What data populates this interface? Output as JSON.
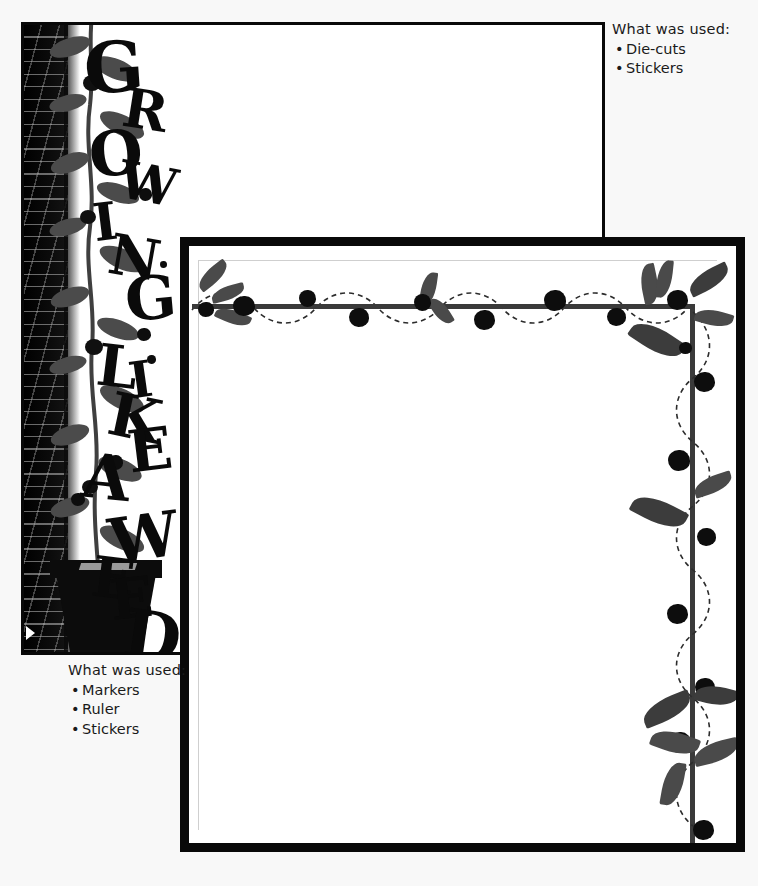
{
  "document": {
    "type": "scrapbook-layout-sketches",
    "background_color": "#f8f8f8",
    "page_count": 2
  },
  "captions": [
    {
      "id": "die-cuts",
      "title": "What was used:",
      "items": [
        "Die-cuts",
        "Stickers"
      ]
    },
    {
      "id": "markers",
      "title": "What was used:",
      "items": [
        "Markers",
        "Ruler",
        "Stickers"
      ]
    }
  ],
  "layouts": [
    {
      "id": "page-1",
      "name": "Growing Like a Weed layout",
      "title_text": "GROWING LIKE A WEED",
      "title_letters": [
        "G",
        "R",
        "O",
        "W",
        "I",
        "N",
        "G",
        "L",
        "I",
        "K",
        "E",
        "A",
        "W",
        "E",
        "E",
        "D"
      ],
      "elements": [
        "brick-wall",
        "climbing-vine",
        "flower-pot",
        "berries",
        "display-arrow"
      ],
      "border_color": "#080808",
      "page_color": "#ffffff"
    },
    {
      "id": "page-2",
      "name": "Berry vine border layout",
      "elements": [
        "thick-black-frame",
        "horizontal-berry-vine",
        "vertical-berry-vine",
        "leaves",
        "dashed-tendril"
      ],
      "border_color": "#090909",
      "stem_color": "#3a3a3a",
      "leaf_color": "#4a4a4a",
      "berry_color": "#0d0d0d",
      "page_color": "#ffffff"
    }
  ],
  "colors": {
    "ink": "#1a1a1a",
    "page_white": "#ffffff",
    "frame_black": "#090909",
    "wall_black": "#0b0b0b",
    "stem_gray": "#3a3a3a",
    "leaf_gray": "#4a4a4a",
    "canvas": "#f8f8f8"
  }
}
